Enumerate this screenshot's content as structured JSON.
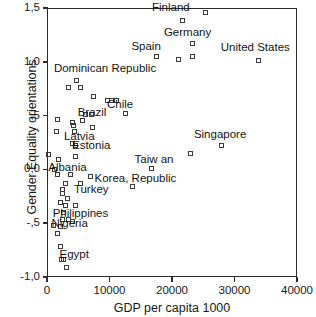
{
  "chart_data": {
    "type": "scatter",
    "title": "",
    "xlabel": "GDP per capita 1000",
    "ylabel": "Gender Equality orientations",
    "xlim": [
      0,
      40000
    ],
    "ylim": [
      -1.0,
      1.5
    ],
    "grid": false,
    "legend": "none",
    "decimal_separator": ",",
    "xticks": [
      {
        "value": 0,
        "label": "0"
      },
      {
        "value": 10000,
        "label": "10000"
      },
      {
        "value": 20000,
        "label": "20000"
      },
      {
        "value": 30000,
        "label": "30000"
      },
      {
        "value": 40000,
        "label": "40000"
      }
    ],
    "yticks": [
      {
        "value": 1.5,
        "label": "1,5"
      },
      {
        "value": 1.0,
        "label": "1,0"
      },
      {
        "value": 0.5,
        "label": ",5"
      },
      {
        "value": 0.0,
        "label": "0,0"
      },
      {
        "value": -0.5,
        "label": "-,5"
      },
      {
        "value": -1.0,
        "label": "-1,0"
      }
    ],
    "points": [
      {
        "x": 25400,
        "y": 1.46,
        "label": "Finland",
        "lx": 16800,
        "ly": 1.5
      },
      {
        "x": 21600,
        "y": 1.38,
        "label": "",
        "lx": 0,
        "ly": 0
      },
      {
        "x": 23300,
        "y": 1.17,
        "label": "Germany",
        "lx": 18700,
        "ly": 1.27
      },
      {
        "x": 17500,
        "y": 1.05,
        "label": "Spain",
        "lx": 13500,
        "ly": 1.14
      },
      {
        "x": 23200,
        "y": 1.05,
        "label": "",
        "lx": 0,
        "ly": 0
      },
      {
        "x": 21000,
        "y": 1.02,
        "label": "",
        "lx": 0,
        "ly": 0
      },
      {
        "x": 33800,
        "y": 1.01,
        "label": "United States",
        "lx": 27800,
        "ly": 1.13
      },
      {
        "x": 4700,
        "y": 0.83,
        "label": "Dominican Republic",
        "lx": 1100,
        "ly": 0.93
      },
      {
        "x": 3500,
        "y": 0.76,
        "label": "",
        "lx": 0,
        "ly": 0
      },
      {
        "x": 5300,
        "y": 0.76,
        "label": "",
        "lx": 0,
        "ly": 0
      },
      {
        "x": 7400,
        "y": 0.68,
        "label": "",
        "lx": 0,
        "ly": 0
      },
      {
        "x": 9600,
        "y": 0.64,
        "label": "",
        "lx": 0,
        "ly": 0
      },
      {
        "x": 11100,
        "y": 0.64,
        "label": "Chile",
        "lx": 9600,
        "ly": 0.6
      },
      {
        "x": 10300,
        "y": 0.64,
        "label": "",
        "lx": 0,
        "ly": 0
      },
      {
        "x": 12600,
        "y": 0.52,
        "label": "",
        "lx": 0,
        "ly": 0
      },
      {
        "x": 7100,
        "y": 0.51,
        "label": "Brazil",
        "lx": 4900,
        "ly": 0.52
      },
      {
        "x": 6100,
        "y": 0.51,
        "label": "",
        "lx": 0,
        "ly": 0
      },
      {
        "x": 1700,
        "y": 0.46,
        "label": "",
        "lx": 0,
        "ly": 0
      },
      {
        "x": 4000,
        "y": 0.44,
        "label": "",
        "lx": 0,
        "ly": 0
      },
      {
        "x": 5600,
        "y": 0.45,
        "label": "",
        "lx": 0,
        "ly": 0
      },
      {
        "x": 4200,
        "y": 0.41,
        "label": "",
        "lx": 0,
        "ly": 0
      },
      {
        "x": 7200,
        "y": 0.39,
        "label": "",
        "lx": 0,
        "ly": 0
      },
      {
        "x": 1500,
        "y": 0.35,
        "label": "",
        "lx": 0,
        "ly": 0
      },
      {
        "x": 4400,
        "y": 0.35,
        "label": "Latvia",
        "lx": 2700,
        "ly": 0.3
      },
      {
        "x": 4000,
        "y": 0.24,
        "label": "Estonia",
        "lx": 4000,
        "ly": 0.22
      },
      {
        "x": 4500,
        "y": 0.22,
        "label": "",
        "lx": 0,
        "ly": 0
      },
      {
        "x": 300,
        "y": 0.14,
        "label": "",
        "lx": 0,
        "ly": 0
      },
      {
        "x": 4600,
        "y": 0.12,
        "label": "",
        "lx": 0,
        "ly": 0
      },
      {
        "x": 1900,
        "y": 0.09,
        "label": "",
        "lx": 0,
        "ly": 0
      },
      {
        "x": 27900,
        "y": 0.22,
        "label": "Singapore",
        "lx": 23500,
        "ly": 0.32
      },
      {
        "x": 23000,
        "y": 0.15,
        "label": "",
        "lx": 0,
        "ly": 0
      },
      {
        "x": 16700,
        "y": 0.01,
        "label": "Taiw an",
        "lx": 14000,
        "ly": 0.09
      },
      {
        "x": 1200,
        "y": 0.0,
        "label": "Albania",
        "lx": 200,
        "ly": 0.01
      },
      {
        "x": 1600,
        "y": -0.05,
        "label": "",
        "lx": 0,
        "ly": 0
      },
      {
        "x": 3700,
        "y": -0.05,
        "label": "",
        "lx": 0,
        "ly": 0
      },
      {
        "x": 7000,
        "y": -0.07,
        "label": "Korea, Republic",
        "lx": 7600,
        "ly": -0.09
      },
      {
        "x": 2900,
        "y": -0.13,
        "label": "",
        "lx": 0,
        "ly": 0
      },
      {
        "x": 5300,
        "y": -0.13,
        "label": "",
        "lx": 0,
        "ly": 0
      },
      {
        "x": 13600,
        "y": -0.16,
        "label": "",
        "lx": 0,
        "ly": 0
      },
      {
        "x": 2500,
        "y": -0.19,
        "label": "Turkey",
        "lx": 4300,
        "ly": -0.19
      },
      {
        "x": 2500,
        "y": -0.22,
        "label": "",
        "lx": 0,
        "ly": 0
      },
      {
        "x": 3300,
        "y": -0.27,
        "label": "",
        "lx": 0,
        "ly": 0
      },
      {
        "x": 2100,
        "y": -0.31,
        "label": "",
        "lx": 0,
        "ly": 0
      },
      {
        "x": 3000,
        "y": -0.34,
        "label": "",
        "lx": 0,
        "ly": 0
      },
      {
        "x": 4500,
        "y": -0.34,
        "label": "",
        "lx": 0,
        "ly": 0
      },
      {
        "x": 2700,
        "y": -0.4,
        "label": "Philippines",
        "lx": 900,
        "ly": -0.41
      },
      {
        "x": 2400,
        "y": -0.47,
        "label": "",
        "lx": 0,
        "ly": 0
      },
      {
        "x": 3400,
        "y": -0.47,
        "label": "",
        "lx": 0,
        "ly": 0
      },
      {
        "x": 4000,
        "y": -0.48,
        "label": "",
        "lx": 0,
        "ly": 0
      },
      {
        "x": 1100,
        "y": -0.52,
        "label": "Nigeria",
        "lx": 700,
        "ly": -0.51
      },
      {
        "x": 2200,
        "y": -0.53,
        "label": "",
        "lx": 0,
        "ly": 0
      },
      {
        "x": 1600,
        "y": -0.6,
        "label": "",
        "lx": 0,
        "ly": 0
      },
      {
        "x": 2200,
        "y": -0.72,
        "label": "",
        "lx": 0,
        "ly": 0
      },
      {
        "x": 2300,
        "y": -0.84,
        "label": "Egypt",
        "lx": 2000,
        "ly": -0.8
      },
      {
        "x": 2700,
        "y": -0.84,
        "label": "",
        "lx": 0,
        "ly": 0
      },
      {
        "x": 3100,
        "y": -0.91,
        "label": "",
        "lx": 0,
        "ly": 0
      }
    ]
  }
}
